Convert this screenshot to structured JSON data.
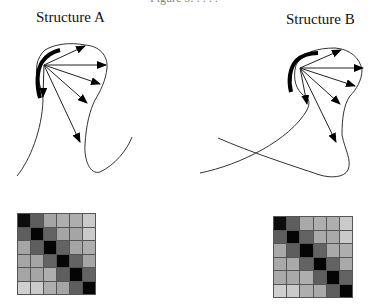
{
  "figure": {
    "cut_caption": "Figure 5: . . . .",
    "structures": [
      {
        "id": "A",
        "title": "Structure A",
        "matrix": [
          [
            0.05,
            0.4,
            0.7,
            0.74,
            0.74,
            0.86
          ],
          [
            0.4,
            0.02,
            0.42,
            0.7,
            0.7,
            0.86
          ],
          [
            0.7,
            0.4,
            0.02,
            0.42,
            0.7,
            0.74
          ],
          [
            0.7,
            0.7,
            0.42,
            0.02,
            0.42,
            0.7
          ],
          [
            0.7,
            0.7,
            0.74,
            0.4,
            0.02,
            0.42
          ],
          [
            0.88,
            0.86,
            0.74,
            0.7,
            0.4,
            0.02
          ]
        ]
      },
      {
        "id": "B",
        "title": "Structure B",
        "matrix": [
          [
            0.05,
            0.4,
            0.72,
            0.74,
            0.74,
            0.86
          ],
          [
            0.4,
            0.02,
            0.42,
            0.72,
            0.72,
            0.86
          ],
          [
            0.72,
            0.4,
            0.02,
            0.42,
            0.72,
            0.74
          ],
          [
            0.72,
            0.72,
            0.42,
            0.02,
            0.42,
            0.72
          ],
          [
            0.72,
            0.72,
            0.74,
            0.4,
            0.02,
            0.42
          ],
          [
            0.88,
            0.86,
            0.74,
            0.72,
            0.4,
            0.02
          ]
        ]
      }
    ]
  }
}
